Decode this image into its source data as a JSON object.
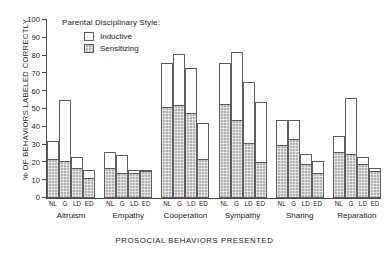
{
  "legend": {
    "title": "Parental Disciplinary Style:",
    "entries": [
      {
        "label": "Inductive",
        "swatch": "white-open-square"
      },
      {
        "label": "Sensitizing",
        "swatch": "gray-hatched-square"
      }
    ]
  },
  "chart_data": {
    "type": "bar",
    "title": "",
    "xlabel": "PROSOCIAL BEHAVIORS PRESENTED",
    "ylabel": "% OF BEHAVIORS LABELED CORRECTLY",
    "ylim": [
      0,
      100
    ],
    "yticks": [
      0,
      10,
      20,
      30,
      40,
      50,
      60,
      70,
      80,
      90,
      100
    ],
    "grid": false,
    "legend_position": "upper-left-inside",
    "subgroup_labels": [
      "NL",
      "G",
      "LD",
      "ED"
    ],
    "categories": [
      "Altruism",
      "Empathy",
      "Cooperation",
      "Sympathy",
      "Sharing",
      "Reparation"
    ],
    "series": [
      {
        "name": "Inductive",
        "values": [
          [
            32,
            55,
            23,
            16
          ],
          [
            26,
            24,
            16,
            16
          ],
          [
            76,
            81,
            73,
            42
          ],
          [
            76,
            82,
            65,
            54
          ],
          [
            44,
            44,
            25,
            21
          ],
          [
            35,
            56,
            23,
            17
          ]
        ]
      },
      {
        "name": "Sensitizing",
        "values": [
          [
            22,
            21,
            17,
            11
          ],
          [
            17,
            14,
            14,
            15
          ],
          [
            51,
            52,
            48,
            22
          ],
          [
            53,
            44,
            31,
            20
          ],
          [
            30,
            33,
            19,
            14
          ],
          [
            26,
            25,
            19,
            15
          ]
        ]
      }
    ]
  }
}
